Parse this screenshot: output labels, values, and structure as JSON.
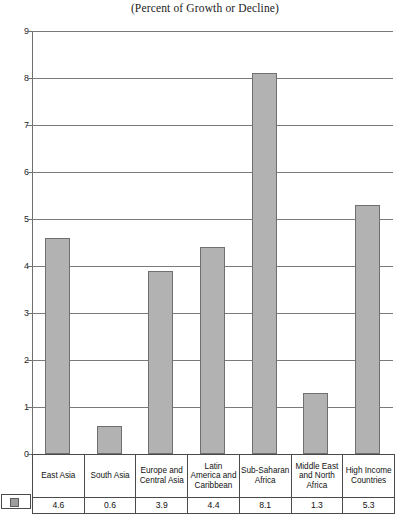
{
  "chart_data": {
    "type": "bar",
    "title": "(Percent of Growth or Decline)",
    "xlabel": "",
    "ylabel": "",
    "ylim": [
      0,
      9
    ],
    "ytick_step": 1,
    "grid": true,
    "legend": "none",
    "categories": [
      "East Asia",
      "South Asia",
      "Europe and Central Asia",
      "Latin America and Caribbean",
      "Sub-Saharan Africa",
      "Middle East and North Africa",
      "High Income Countries"
    ],
    "values": [
      4.6,
      0.6,
      3.9,
      4.4,
      8.1,
      1.3,
      5.3
    ],
    "value_labels": [
      "4.6",
      "0.6",
      "3.9",
      "4.4",
      "8.1",
      "1.3",
      "5.3"
    ],
    "ytick_labels": [
      "9",
      "8",
      "7",
      "6",
      "5",
      "4",
      "3",
      "2",
      "1",
      "0"
    ],
    "bar_color": "#b2b2b2",
    "bar_border_color": "#6f6f6f",
    "gridline_color": "#7a7a7a",
    "axis_color": "#6e6e6e"
  },
  "table": {
    "label_row": [
      "East Asia",
      "South Asia",
      "Europe and Central Asia",
      "Latin America and Caribbean",
      "Sub-Saharan Africa",
      "Middle East and North Africa",
      "High Income Countries"
    ],
    "value_row": [
      "4.6",
      "0.6",
      "3.9",
      "4.4",
      "8.1",
      "1.3",
      "5.3"
    ],
    "legend_swatch_color": "#9d9d9d"
  }
}
